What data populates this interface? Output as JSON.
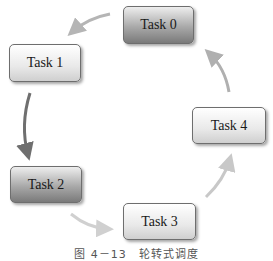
{
  "diagram": {
    "type": "cycle",
    "direction": "counter-clockwise",
    "nodes": [
      {
        "id": "task0",
        "label": "Task 0",
        "style": "dark"
      },
      {
        "id": "task1",
        "label": "Task 1",
        "style": "light"
      },
      {
        "id": "task2",
        "label": "Task 2",
        "style": "dark"
      },
      {
        "id": "task3",
        "label": "Task 3",
        "style": "light"
      },
      {
        "id": "task4",
        "label": "Task 4",
        "style": "light"
      }
    ],
    "edges": [
      {
        "from": "task0",
        "to": "task1",
        "color": "#b5b5b5"
      },
      {
        "from": "task1",
        "to": "task2",
        "color": "#6f6f6f"
      },
      {
        "from": "task2",
        "to": "task3",
        "color": "#d0d0d0"
      },
      {
        "from": "task3",
        "to": "task4",
        "color": "#c8c8c8"
      },
      {
        "from": "task4",
        "to": "task0",
        "color": "#b0b0b0"
      }
    ]
  },
  "caption": "图 4－13　轮转式调度"
}
